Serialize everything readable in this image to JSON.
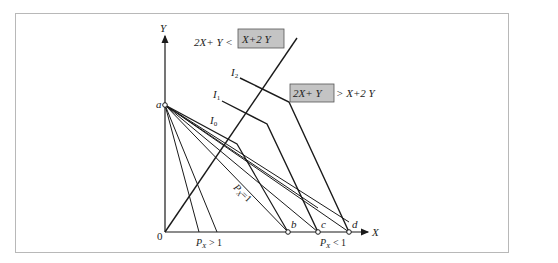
{
  "diagram": {
    "axes": {
      "x_label": "X",
      "y_label": "Y",
      "origin_label": "0"
    },
    "points": {
      "a": "a",
      "b": "b",
      "c": "c",
      "d": "d"
    },
    "curves": {
      "i0": "I",
      "i0_sub": "0",
      "i1": "I",
      "i1_sub": "1",
      "i2": "I",
      "i2_sub": "2"
    },
    "price_labels": {
      "px_gt_1": "P",
      "px_gt_1_sub": "X",
      "px_gt_1_rest": " > 1",
      "px_eq_1": "P",
      "px_eq_1_sub": "X",
      "px_eq_1_rest": "=1",
      "px_lt_1": "P",
      "px_lt_1_sub": "X",
      "px_lt_1_rest": " < 1"
    },
    "inequalities": {
      "top_left": "2X+ Y <",
      "top_boxed": "X+2 Y",
      "right_boxed": "2X+ Y",
      "right_rest": "> X+2 Y"
    },
    "colors": {
      "line": "#1a1a1a",
      "box_fill": "#c4c4c4",
      "box_border": "#555555",
      "frame_border": "#b8b8b8"
    }
  }
}
